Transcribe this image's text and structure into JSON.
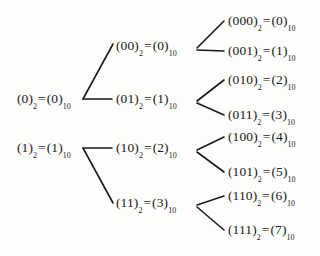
{
  "diagram": {
    "background_color": "#fdfdfb",
    "ink_color": "#1a1a1a",
    "eq": "=",
    "sub_binary": "2",
    "sub_decimal": "10",
    "roots": [
      {
        "id": "n0",
        "binary": "(0)",
        "decimal": "(0)"
      },
      {
        "id": "n1",
        "binary": "(1)",
        "decimal": "(1)"
      }
    ],
    "level2": [
      {
        "id": "n00",
        "binary": "(00)",
        "decimal": "(0)"
      },
      {
        "id": "n01",
        "binary": "(01)",
        "decimal": "(1)"
      },
      {
        "id": "n10",
        "binary": "(10)",
        "decimal": "(2)"
      },
      {
        "id": "n11",
        "binary": "(11)",
        "decimal": "(3)"
      }
    ],
    "leaves": [
      {
        "id": "n000",
        "binary": "(000)",
        "decimal": "(0)"
      },
      {
        "id": "n001",
        "binary": "(001)",
        "decimal": "(1)"
      },
      {
        "id": "n010",
        "binary": "(010)",
        "decimal": "(2)"
      },
      {
        "id": "n011",
        "binary": "(011)",
        "decimal": "(3)"
      },
      {
        "id": "n100",
        "binary": "(100)",
        "decimal": "(4)"
      },
      {
        "id": "n101",
        "binary": "(101)",
        "decimal": "(5)"
      },
      {
        "id": "n110",
        "binary": "(110)",
        "decimal": "(6)"
      },
      {
        "id": "n111",
        "binary": "(111)",
        "decimal": "(7)"
      }
    ]
  }
}
